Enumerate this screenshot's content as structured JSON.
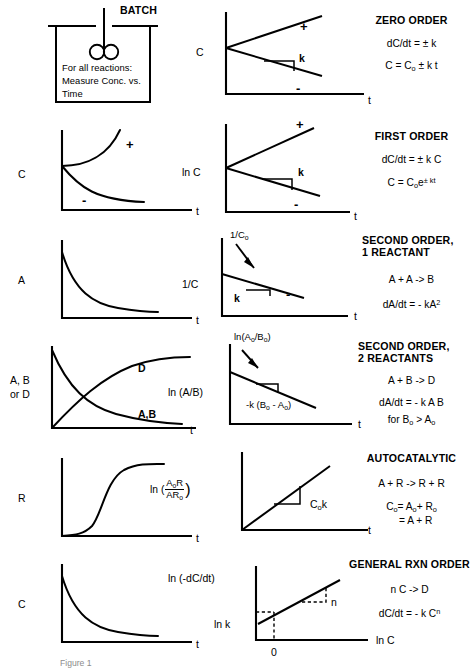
{
  "figure": {
    "caption": "Figure 1"
  },
  "reactor": {
    "label": "BATCH",
    "instruction_line1": "For all reactions:",
    "instruction_line2": "Measure Conc. vs.",
    "instruction_line3": "Time",
    "stirrer_icon": "impeller-icon"
  },
  "rows": [
    {
      "id": "zero-order",
      "conc_plot": {
        "present": false
      },
      "linear_plot": {
        "ylabel": "C",
        "xlabel": "t",
        "slope_label": "k",
        "plus_label": "+",
        "minus_label": "-",
        "type": "two-lines-from-intercept"
      },
      "title": "ZERO  ORDER",
      "equations": [
        {
          "html": "dC/dt = &plusmn; k"
        },
        {
          "html": "C = C<sub>o</sub> &plusmn; k t"
        }
      ]
    },
    {
      "id": "first-order",
      "conc_plot": {
        "present": true,
        "ylabel": "C",
        "xlabel": "t",
        "plus_label": "+",
        "minus_label": "-",
        "type": "exponential-growth-and-decay"
      },
      "linear_plot": {
        "ylabel": "ln C",
        "xlabel": "t",
        "slope_label": "k",
        "plus_label": "+",
        "minus_label": "-",
        "type": "two-lines-from-intercept"
      },
      "title": "FIRST  ORDER",
      "equations": [
        {
          "html": "dC/dt = &plusmn; k C"
        },
        {
          "html": "C = C<sub>o</sub>e<sup>&plusmn; kt</sup>"
        }
      ]
    },
    {
      "id": "second-order-1-reactant",
      "conc_plot": {
        "present": true,
        "ylabel": "A",
        "xlabel": "t",
        "type": "decay"
      },
      "linear_plot": {
        "ylabel": "1/C",
        "xlabel": "t",
        "intercept_label": "1/C<sub>o</sub>",
        "slope_label": "k",
        "minus_label": "-",
        "type": "declining-line-with-arrow"
      },
      "title_line1": "SECOND ORDER,",
      "title_line2": "1 REACTANT",
      "equations": [
        {
          "html": "A + A -&gt; B"
        },
        {
          "html": "dA/dt = - kA<sup>2</sup>"
        }
      ]
    },
    {
      "id": "second-order-2-reactants",
      "conc_plot": {
        "present": true,
        "ylabel_line1": "A, B",
        "ylabel_line2": "or D",
        "xlabel": "t",
        "curve_label_d": "D",
        "curve_label_ab": "A,B",
        "type": "crossing-growth-and-decay"
      },
      "linear_plot": {
        "ylabel": "ln  (A/B)",
        "xlabel": "t",
        "intercept_label": "ln(A<sub>o</sub>/B<sub>o</sub>)",
        "slope_label": "-k (B<sub>o</sub> - A<sub>o</sub>)",
        "type": "declining-line-with-arrow"
      },
      "title_line1": "SECOND  ORDER,",
      "title_line2": "2 REACTANTS",
      "equations": [
        {
          "html": "A + B -&gt; D"
        },
        {
          "html": "dA/dt = - k A B"
        },
        {
          "html": "for B<sub>o</sub> &gt; A<sub>o</sub>"
        }
      ]
    },
    {
      "id": "autocatalytic",
      "conc_plot": {
        "present": true,
        "ylabel": "R",
        "xlabel": "t",
        "type": "sigmoid"
      },
      "linear_plot": {
        "ylabel_prefix": "ln (",
        "ylabel_num": "A<sub>o</sub>R",
        "ylabel_den": "AR<sub>o</sub>",
        "ylabel_suffix": ")",
        "xlabel": "t",
        "slope_label": "C<sub>o</sub>k",
        "type": "rising-line-from-origin"
      },
      "title": "AUTOCATALYTIC",
      "equations": [
        {
          "html": "A + R -&gt; R + R"
        },
        {
          "html": "C<sub>o</sub>= A<sub>o</sub>+ R<sub>o</sub>"
        },
        {
          "html": "&nbsp;&nbsp;&nbsp;= A + R"
        }
      ]
    },
    {
      "id": "general-rxn-order",
      "conc_plot": {
        "present": true,
        "ylabel": "C",
        "xlabel": "t",
        "type": "decay"
      },
      "linear_plot": {
        "ylabel": "ln (-dC/dt)",
        "xlabel": "ln C",
        "intercept_label": "ln k",
        "origin_label": "0",
        "slope_label": "n",
        "type": "rising-line-with-intercept"
      },
      "title": "GENERAL  RXN ORDER",
      "equations": [
        {
          "html": "n C -&gt; D"
        },
        {
          "html": "dC/dt = - k C<sup>n</sup>"
        }
      ]
    }
  ],
  "chart_data": {
    "type": "line",
    "panels": [
      {
        "row": "zero-order",
        "plot": "linear",
        "xlabel": "t",
        "ylabel": "C",
        "series": [
          {
            "name": "+",
            "x": [
              0,
              1
            ],
            "y": [
              0.5,
              0.95
            ],
            "note": "positive slope +k"
          },
          {
            "name": "-",
            "x": [
              0,
              1
            ],
            "y": [
              0.5,
              0.12
            ],
            "note": "negative slope -k"
          }
        ],
        "annotations": [
          "k"
        ]
      },
      {
        "row": "first-order",
        "plot": "concentration",
        "xlabel": "t",
        "ylabel": "C",
        "series": [
          {
            "name": "+",
            "x": [
              0,
              0.25,
              0.5,
              0.75,
              1
            ],
            "y": [
              0.45,
              0.55,
              0.7,
              0.88,
              1.0
            ]
          },
          {
            "name": "-",
            "x": [
              0,
              0.25,
              0.5,
              0.75,
              1
            ],
            "y": [
              0.45,
              0.25,
              0.14,
              0.09,
              0.07
            ]
          }
        ]
      },
      {
        "row": "first-order",
        "plot": "linear",
        "xlabel": "t",
        "ylabel": "ln C",
        "series": [
          {
            "name": "+",
            "x": [
              0,
              1
            ],
            "y": [
              0.5,
              0.97
            ]
          },
          {
            "name": "-",
            "x": [
              0,
              1
            ],
            "y": [
              0.5,
              0.13
            ]
          }
        ],
        "annotations": [
          "k"
        ]
      },
      {
        "row": "second-order-1-reactant",
        "plot": "concentration",
        "xlabel": "t",
        "ylabel": "A",
        "series": [
          {
            "name": "A",
            "x": [
              0,
              0.2,
              0.4,
              0.6,
              0.8,
              1
            ],
            "y": [
              0.92,
              0.42,
              0.25,
              0.17,
              0.12,
              0.1
            ]
          }
        ]
      },
      {
        "row": "second-order-1-reactant",
        "plot": "linear",
        "xlabel": "t",
        "ylabel": "1/C",
        "series": [
          {
            "name": "1/C",
            "x": [
              0,
              1
            ],
            "y": [
              0.62,
              0.18
            ]
          }
        ],
        "annotations": [
          "1/Co",
          "k",
          "-"
        ]
      },
      {
        "row": "second-order-2-reactants",
        "plot": "concentration",
        "xlabel": "t",
        "ylabel": "A, B or D",
        "series": [
          {
            "name": "D",
            "x": [
              0,
              0.2,
              0.4,
              0.6,
              0.8,
              1
            ],
            "y": [
              0.0,
              0.35,
              0.6,
              0.76,
              0.85,
              0.88
            ]
          },
          {
            "name": "A,B",
            "x": [
              0,
              0.2,
              0.4,
              0.6,
              0.8,
              1
            ],
            "y": [
              0.95,
              0.6,
              0.38,
              0.24,
              0.15,
              0.1
            ]
          }
        ]
      },
      {
        "row": "second-order-2-reactants",
        "plot": "linear",
        "xlabel": "t",
        "ylabel": "ln (A/B)",
        "series": [
          {
            "name": "ln(A/B)",
            "x": [
              0,
              1
            ],
            "y": [
              0.78,
              0.22
            ]
          }
        ],
        "annotations": [
          "ln(Ao/Bo)",
          "-k (Bo - Ao)"
        ]
      },
      {
        "row": "autocatalytic",
        "plot": "concentration",
        "xlabel": "t",
        "ylabel": "R",
        "series": [
          {
            "name": "R",
            "x": [
              0,
              0.2,
              0.35,
              0.5,
              0.65,
              0.8,
              1
            ],
            "y": [
              0.02,
              0.05,
              0.22,
              0.6,
              0.8,
              0.88,
              0.92
            ]
          }
        ]
      },
      {
        "row": "autocatalytic",
        "plot": "linear",
        "xlabel": "t",
        "ylabel": "ln (AoR/ARo)",
        "series": [
          {
            "name": "line",
            "x": [
              0,
              1
            ],
            "y": [
              0.0,
              0.92
            ]
          }
        ],
        "annotations": [
          "Cok"
        ]
      },
      {
        "row": "general-rxn-order",
        "plot": "concentration",
        "xlabel": "t",
        "ylabel": "C",
        "series": [
          {
            "name": "C",
            "x": [
              0,
              0.2,
              0.4,
              0.6,
              0.8,
              1
            ],
            "y": [
              0.92,
              0.45,
              0.28,
              0.19,
              0.14,
              0.11
            ]
          }
        ]
      },
      {
        "row": "general-rxn-order",
        "plot": "linear",
        "xlabel": "ln C",
        "ylabel": "ln (-dC/dt)",
        "series": [
          {
            "name": "line",
            "x": [
              -0.15,
              1
            ],
            "y": [
              0.22,
              0.95
            ]
          }
        ],
        "annotations": [
          "ln k",
          "0",
          "n"
        ],
        "grid": false
      }
    ]
  }
}
